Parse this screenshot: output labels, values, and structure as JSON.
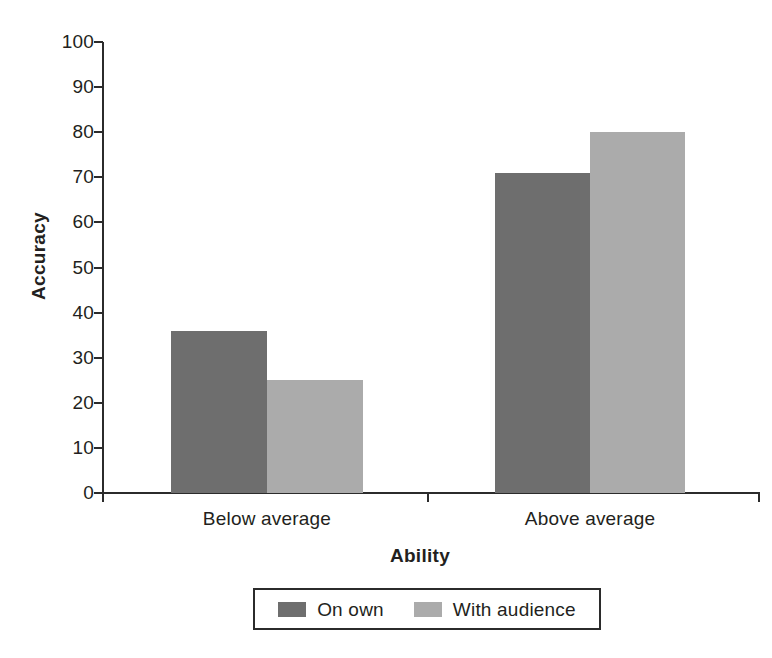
{
  "chart_data": {
    "type": "bar",
    "title": "",
    "subtitle": "",
    "xlabel": "Ability",
    "ylabel": "Accuracy",
    "categories": [
      "Below average",
      "Above average"
    ],
    "series": [
      {
        "name": "On own",
        "color": "#6e6e6e",
        "values": [
          36,
          71
        ]
      },
      {
        "name": "With audience",
        "color": "#ababab",
        "values": [
          25,
          80
        ]
      }
    ],
    "ylim": [
      0,
      100
    ],
    "y_ticks": [
      0,
      10,
      20,
      30,
      40,
      50,
      60,
      70,
      80,
      90,
      100
    ],
    "y_tick_labels": [
      "0",
      "10",
      "20",
      "30",
      "40",
      "50",
      "60",
      "70",
      "80",
      "90",
      "100"
    ],
    "grid": false,
    "legend_position": "bottom",
    "legend_entries": [
      "On own",
      "With audience"
    ],
    "bar_style": "grouped",
    "background_color": "#ffffff",
    "axis_color": "#2b2b2b",
    "text_color": "#231f20"
  }
}
